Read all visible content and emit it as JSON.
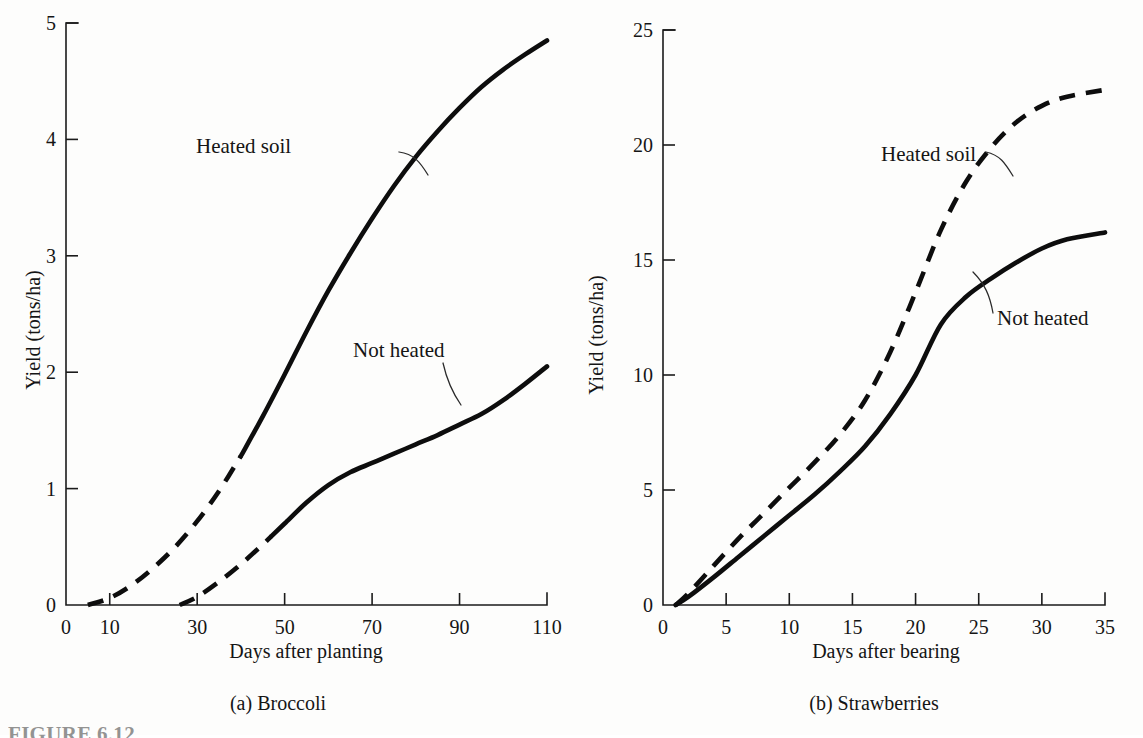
{
  "figure": {
    "footnote": "FIGURE 6.12",
    "background_color": "#fdfdfc",
    "ink_color": "#0d0d0d"
  },
  "chart_data": [
    {
      "type": "line",
      "panel_id": "a",
      "caption": "(a)  Broccoli",
      "title": "",
      "xlabel": "Days after planting",
      "ylabel": "Yield (tons/ha)",
      "xlim": [
        0,
        110
      ],
      "ylim": [
        0,
        5
      ],
      "xticks": [
        0,
        10,
        30,
        50,
        70,
        90,
        110
      ],
      "xticklabels": [
        "0",
        "10",
        "30",
        "50",
        "70",
        "90",
        "110"
      ],
      "yticks": [
        0,
        1,
        2,
        3,
        4,
        5
      ],
      "yticklabels": [
        "0",
        "1",
        "2",
        "3",
        "4",
        "5"
      ],
      "grid": false,
      "legend": "inline-annotations",
      "series": [
        {
          "name": "Heated soil",
          "style": "dashed-then-solid",
          "dashed_until_x": 40,
          "x": [
            5,
            10,
            15,
            20,
            25,
            30,
            35,
            40,
            45,
            50,
            55,
            60,
            65,
            70,
            75,
            80,
            85,
            90,
            95,
            100,
            105,
            110
          ],
          "values": [
            0.0,
            0.06,
            0.17,
            0.32,
            0.5,
            0.72,
            0.98,
            1.28,
            1.62,
            1.98,
            2.35,
            2.7,
            3.02,
            3.32,
            3.6,
            3.85,
            4.07,
            4.27,
            4.45,
            4.6,
            4.73,
            4.85
          ]
        },
        {
          "name": "Not heated",
          "style": "dashed-then-solid",
          "dashed_until_x": 47,
          "x": [
            26,
            30,
            35,
            40,
            45,
            50,
            55,
            60,
            65,
            70,
            75,
            80,
            85,
            90,
            95,
            100,
            105,
            110
          ],
          "values": [
            0.0,
            0.07,
            0.2,
            0.35,
            0.52,
            0.7,
            0.88,
            1.03,
            1.14,
            1.22,
            1.3,
            1.38,
            1.46,
            1.55,
            1.64,
            1.76,
            1.9,
            2.05
          ]
        }
      ],
      "annotations": [
        {
          "text": "Heated soil",
          "target_series": "Heated soil"
        },
        {
          "text": "Not heated",
          "target_series": "Not heated"
        }
      ]
    },
    {
      "type": "line",
      "panel_id": "b",
      "caption": "(b)  Strawberries",
      "title": "",
      "xlabel": "Days after bearing",
      "ylabel": "Yield (tons/ha)",
      "xlim": [
        0,
        35
      ],
      "ylim": [
        0,
        25
      ],
      "xticks": [
        0,
        5,
        10,
        15,
        20,
        25,
        30,
        35
      ],
      "xticklabels": [
        "0",
        "5",
        "10",
        "15",
        "20",
        "25",
        "30",
        "35"
      ],
      "yticks": [
        0,
        5,
        10,
        15,
        20,
        25
      ],
      "yticklabels": [
        "0",
        "5",
        "10",
        "15",
        "20",
        "25"
      ],
      "grid": false,
      "legend": "inline-annotations",
      "series": [
        {
          "name": "Heated soil",
          "style": "dashed",
          "x": [
            1,
            2,
            4,
            6,
            8,
            10,
            12,
            14,
            16,
            18,
            20,
            22,
            24,
            26,
            28,
            30,
            32,
            35
          ],
          "values": [
            0.0,
            0.5,
            1.7,
            2.9,
            4.0,
            5.1,
            6.2,
            7.4,
            8.9,
            11.0,
            13.6,
            16.3,
            18.4,
            19.9,
            21.0,
            21.7,
            22.1,
            22.4
          ]
        },
        {
          "name": "Not heated",
          "style": "solid",
          "x": [
            1,
            2,
            4,
            6,
            8,
            10,
            12,
            14,
            16,
            18,
            20,
            22,
            24,
            26,
            28,
            30,
            32,
            35
          ],
          "values": [
            0.0,
            0.35,
            1.2,
            2.1,
            3.0,
            3.9,
            4.8,
            5.8,
            6.9,
            8.3,
            10.0,
            12.2,
            13.4,
            14.2,
            14.9,
            15.5,
            15.9,
            16.2
          ]
        }
      ],
      "annotations": [
        {
          "text": "Heated soil",
          "target_series": "Heated soil"
        },
        {
          "text": "Not heated",
          "target_series": "Not heated"
        }
      ]
    }
  ]
}
